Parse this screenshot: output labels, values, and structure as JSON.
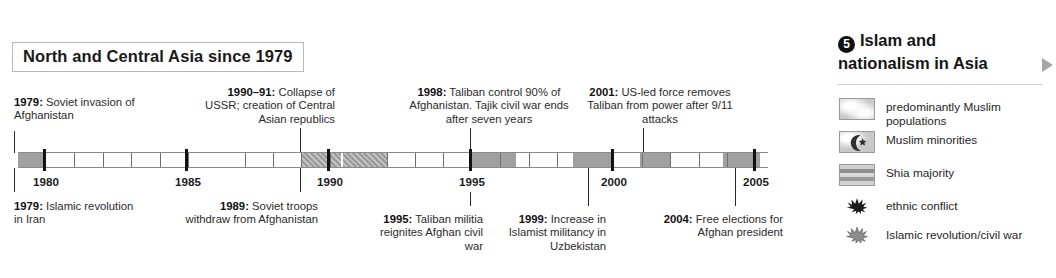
{
  "timeline": {
    "title": "North and Central Asia since 1979",
    "axis": {
      "start_year": 1979,
      "end_year": 2005.5,
      "major_ticks": [
        1980,
        1985,
        1990,
        1995,
        2000,
        2005
      ],
      "major_tick_labels": [
        "1980",
        "1985",
        "1990",
        "1995",
        "2000",
        "2005"
      ]
    },
    "shaded_periods": [
      {
        "from": 1979.0,
        "to": 1980.0
      },
      {
        "from": 1989.0,
        "to": 1990.4
      },
      {
        "from": 1990.4,
        "to": 1992.0
      },
      {
        "from": 1995.0,
        "to": 1996.6
      },
      {
        "from": 1998.6,
        "to": 2000.0
      },
      {
        "from": 2000.9,
        "to": 2002.0
      },
      {
        "from": 2004.0,
        "to": 2005.3
      }
    ],
    "events_above": [
      {
        "year": 1979,
        "year_label": "1979:",
        "text": "Soviet invasion of Afghanistan",
        "align": "left"
      },
      {
        "year": 1990,
        "year_label": "1990–91:",
        "text": "Collapse of USSR; creation of Central Asian republics",
        "align": "right"
      },
      {
        "year": 1998,
        "year_label": "1998:",
        "text": "Taliban control 90% of Afghanistan. Tajik civil war ends after seven years",
        "align": "left"
      },
      {
        "year": 2001,
        "year_label": "2001:",
        "text": "US-led force removes Taliban from power after 9/11 attacks",
        "align": "left"
      }
    ],
    "events_below": [
      {
        "year": 1979,
        "year_label": "1979:",
        "text": "Islamic revolution in Iran",
        "align": "left"
      },
      {
        "year": 1989,
        "year_label": "1989:",
        "text": "Soviet troops withdraw from Afghanistan",
        "align": "right"
      },
      {
        "year": 1995,
        "year_label": "1995:",
        "text": "Taliban militia reignites Afghan civil war",
        "align": "right"
      },
      {
        "year": 1999,
        "year_label": "1999:",
        "text": "Increase in Islamist militancy in Uzbekistan",
        "align": "right"
      },
      {
        "year": 2004,
        "year_label": "2004:",
        "text": "Free elections for Afghan president",
        "align": "right"
      }
    ]
  },
  "legend": {
    "number": "5",
    "title": "Islam and nationalism in Asia",
    "arrow_icon": "triangle-right-icon",
    "items": [
      {
        "label": "predominantly Muslim populations",
        "swatch": "fill-gray-plain",
        "icon_name": "swatch-predominantly-muslim"
      },
      {
        "label": "Muslim minorities",
        "swatch": "fill-gray-crescent",
        "icon_name": "swatch-muslim-minorities"
      },
      {
        "label": "Shia majority",
        "swatch": "fill-gray-stripe",
        "icon_name": "swatch-shia-majority"
      },
      {
        "label": "ethnic conflict",
        "swatch": "glyph-burst-black",
        "icon_name": "ethnic-conflict-icon"
      },
      {
        "label": "Islamic revolution/civil war",
        "swatch": "glyph-burst-gray",
        "icon_name": "islamic-revolution-icon"
      }
    ]
  },
  "colors": {
    "shade": "#a0a0a0",
    "ink": "#231f20",
    "rule": "#cfcfcf",
    "arrow": "#a5a5a5"
  }
}
